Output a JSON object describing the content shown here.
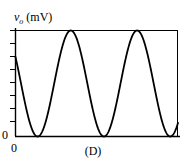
{
  "figure": {
    "caption": "(D)",
    "background_color": "#ffffff",
    "line_color": "#000000",
    "axis_color": "#000000",
    "width": 186,
    "height": 162
  },
  "axis_labels": {
    "y_variable": "v",
    "y_subscript": "o",
    "y_units": "(mV)",
    "y_origin_tick": "0",
    "x_origin_tick": "0"
  },
  "chart_data": {
    "type": "line",
    "title": "",
    "subtitle": "",
    "xlabel": "",
    "ylabel": "v_o (mV)",
    "caption": "(D)",
    "grid": false,
    "legend": null,
    "legend_position": "none",
    "xlim": [
      0,
      2.45
    ],
    "ylim": [
      0,
      1
    ],
    "x_tick_labels": [
      "0"
    ],
    "y_tick_labels": [
      "0"
    ],
    "y_minor_ticks": 9,
    "series": [
      {
        "name": "v_o",
        "waveform": "sine",
        "amplitude": 0.5,
        "offset": 0.5,
        "period": 1.0,
        "phase_deg": 150,
        "peaks_x": [
          0.333,
          1.333,
          2.333
        ],
        "minima_x": [
          0.833,
          1.833
        ],
        "start_value": 0.75,
        "min_value": 0,
        "max_value": 1,
        "points_x": [
          0.0,
          0.1,
          0.2,
          0.3,
          0.333,
          0.4,
          0.5,
          0.6,
          0.7,
          0.8,
          0.833,
          0.9,
          1.0,
          1.1,
          1.2,
          1.3,
          1.333,
          1.4,
          1.5,
          1.6,
          1.7,
          1.8,
          1.833,
          1.9,
          2.0,
          2.1,
          2.2,
          2.3,
          2.333,
          2.4,
          2.45
        ],
        "points_y": [
          0.75,
          0.952,
          1.0,
          0.976,
          1.0,
          0.905,
          0.655,
          0.345,
          0.095,
          0.003,
          0.0,
          0.024,
          0.25,
          0.55,
          0.845,
          0.988,
          1.0,
          0.976,
          0.75,
          0.45,
          0.155,
          0.012,
          0.0,
          0.024,
          0.25,
          0.55,
          0.845,
          0.988,
          1.0,
          0.976,
          0.93
        ]
      }
    ]
  }
}
